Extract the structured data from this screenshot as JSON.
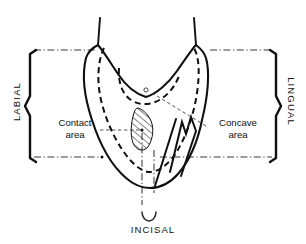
{
  "figure": {
    "background_color": "#ffffff",
    "line_color": "#101010"
  },
  "labels": {
    "labial": "LABIAL",
    "lingual": "LINGUAL",
    "incisal": "INCISAL",
    "contact_area_line1": "Contact",
    "contact_area_line2": "area",
    "concave_area_line1": "Concave",
    "concave_area_line2": "area"
  },
  "annotations": {
    "contact_area_marker": "hatched-contact-region",
    "concave_area_marker": "concave-ridge-notch",
    "center_point_marker": "center-reference-circle"
  },
  "braces": {
    "left_brace": "labial-extent-brace",
    "right_brace": "lingual-extent-brace",
    "bottom_brace": "incisal-extent-brace"
  },
  "reference_lines": {
    "top_axis": "upper-horizontal-reference",
    "bottom_axis": "lower-horizontal-reference",
    "vertical_axis": "midline-vertical-reference"
  }
}
